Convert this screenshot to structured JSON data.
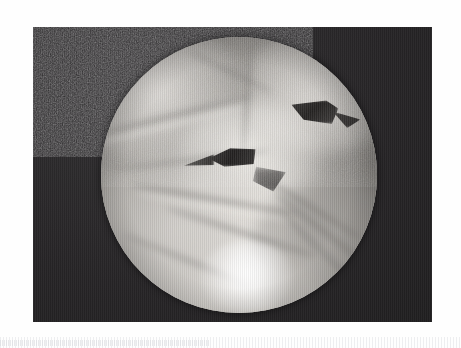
{
  "page": {
    "width": 461,
    "height": 348,
    "background_color": "#ffffff",
    "caption": ""
  },
  "photo": {
    "type": "endoscopic-photograph",
    "description": "Grayscale endoscopic (arthroscopic) still image: circular field of view showing pale soft tissue with folds and two dark clefts, on a dark rectangular photographic plate",
    "plate": {
      "x": 33,
      "y": 27,
      "width": 399,
      "height": 295,
      "background_color": "#272527",
      "grain": "heavy film grain"
    },
    "scope_view": {
      "shape": "circle",
      "center_x": 233,
      "center_y": 175,
      "radius": 138,
      "tissue_color_light": "#f4f2ef",
      "tissue_color_mid": "#b9b7b3",
      "tissue_color_dark": "#6e6c69",
      "cleft_color": "#2e2c2b",
      "specular_highlight": "bottom-center-right"
    },
    "features": [
      {
        "name": "upper-right-cleft",
        "x": 265,
        "y": 100,
        "width": 46,
        "height": 26
      },
      {
        "name": "central-cleft",
        "x": 210,
        "y": 146,
        "width": 46,
        "height": 20
      },
      {
        "name": "specular-highlight",
        "x": 245,
        "y": 285,
        "width": 60,
        "height": 46
      }
    ]
  },
  "artifact": {
    "name": "scanner-stripe-band",
    "y": 337,
    "height": 11,
    "color": "#e4e5e8"
  }
}
